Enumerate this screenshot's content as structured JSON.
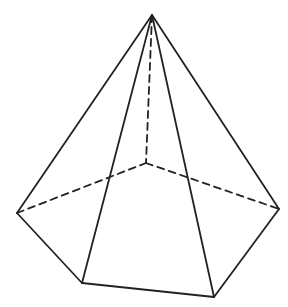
{
  "figure": {
    "width": 288,
    "height": 307,
    "background": "#ffffff",
    "stroke_color": "#222222",
    "stroke_width": 1.8,
    "dash_pattern": "7,5"
  },
  "vertices": {
    "apex": [
      152,
      15
    ],
    "left": [
      17,
      213
    ],
    "right": [
      279,
      209
    ],
    "front_left": [
      82,
      283
    ],
    "front_right": [
      214,
      297
    ],
    "back": [
      146,
      163
    ]
  },
  "visible_edges": [
    [
      "apex",
      "left"
    ],
    [
      "apex",
      "front_left"
    ],
    [
      "apex",
      "front_right"
    ],
    [
      "apex",
      "right"
    ],
    [
      "left",
      "front_left"
    ],
    [
      "front_left",
      "front_right"
    ],
    [
      "front_right",
      "right"
    ]
  ],
  "hidden_edges": [
    [
      "apex",
      "back"
    ],
    [
      "left",
      "back"
    ],
    [
      "back",
      "right"
    ]
  ]
}
